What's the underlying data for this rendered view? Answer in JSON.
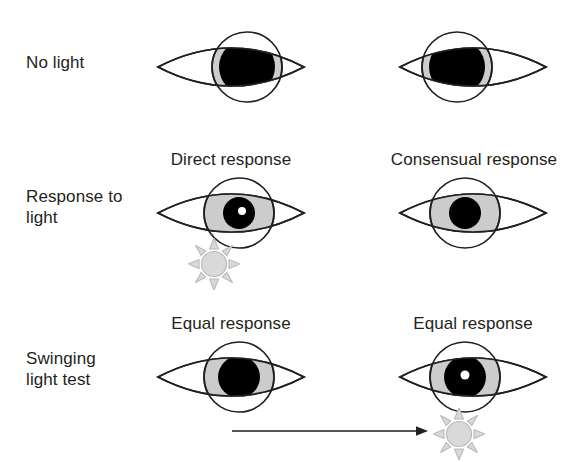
{
  "figure": {
    "width": 579,
    "height": 462,
    "background_color": "#ffffff",
    "ink_color": "#231f20",
    "iris_color": "#cccccc",
    "pupil_color": "#000000",
    "sclera_color": "#ffffff",
    "highlight_color": "#ffffff",
    "sun_fill_color": "#d8d8d8",
    "sun_stroke_color": "#b5b5b5"
  },
  "rows": [
    {
      "id": "no-light",
      "label": "No light",
      "label_x": 26,
      "label_y": 52,
      "column_labels": [],
      "eyes": [
        {
          "id": "no-light-left-eye",
          "side": "left",
          "x": 156,
          "y": 30,
          "width": 150,
          "height": 74,
          "iris_offset_x": 16,
          "iris_radius": 35,
          "pupil_radius": 28,
          "pupil_state": "dilated",
          "highlight": false
        },
        {
          "id": "no-light-right-eye",
          "side": "right",
          "x": 398,
          "y": 30,
          "width": 150,
          "height": 74,
          "iris_offset_x": -16,
          "iris_radius": 35,
          "pupil_radius": 28,
          "pupil_state": "dilated",
          "highlight": false
        }
      ],
      "suns": [],
      "arrows": []
    },
    {
      "id": "response-to-light",
      "label": "Response to\nlight",
      "label_x": 26,
      "label_y": 186,
      "column_labels": [
        {
          "id": "direct-response-label",
          "text": "Direct response",
          "x": 151,
          "y": 150,
          "width": 160
        },
        {
          "id": "consensual-response-label",
          "text": "Consensual response",
          "x": 376,
          "y": 150,
          "width": 196
        }
      ],
      "eyes": [
        {
          "id": "direct-response-eye",
          "side": "left",
          "x": 156,
          "y": 176,
          "width": 150,
          "height": 74,
          "iris_offset_x": 8,
          "iris_radius": 35,
          "pupil_radius": 16,
          "pupil_state": "constricted",
          "highlight": true
        },
        {
          "id": "consensual-response-eye",
          "side": "right",
          "x": 398,
          "y": 176,
          "width": 150,
          "height": 74,
          "iris_offset_x": -8,
          "iris_radius": 35,
          "pupil_radius": 16,
          "pupil_state": "constricted",
          "highlight": false
        }
      ],
      "suns": [
        {
          "id": "direct-response-light-source",
          "x": 188,
          "y": 238,
          "size": 52
        }
      ],
      "arrows": []
    },
    {
      "id": "swinging-light-test",
      "label": "Swinging\nlight test",
      "label_x": 26,
      "label_y": 348,
      "column_labels": [
        {
          "id": "equal-response-left-label",
          "text": "Equal response",
          "x": 153,
          "y": 314,
          "width": 156
        },
        {
          "id": "equal-response-right-label",
          "text": "Equal response",
          "x": 395,
          "y": 314,
          "width": 156
        }
      ],
      "eyes": [
        {
          "id": "swinging-left-eye",
          "side": "left",
          "x": 156,
          "y": 340,
          "width": 150,
          "height": 74,
          "iris_offset_x": 8,
          "iris_radius": 35,
          "pupil_radius": 21,
          "pupil_state": "mid-dilated",
          "highlight": false
        },
        {
          "id": "swinging-right-eye",
          "side": "right",
          "x": 398,
          "y": 340,
          "width": 150,
          "height": 74,
          "iris_offset_x": -8,
          "iris_radius": 35,
          "pupil_radius": 21,
          "pupil_state": "mid-dilated",
          "highlight": true
        }
      ],
      "suns": [
        {
          "id": "swinging-light-source",
          "x": 433,
          "y": 408,
          "size": 52
        }
      ],
      "arrows": [
        {
          "id": "light-swing-arrow",
          "x": 232,
          "y": 420,
          "length": 196,
          "direction": "right"
        }
      ]
    }
  ]
}
